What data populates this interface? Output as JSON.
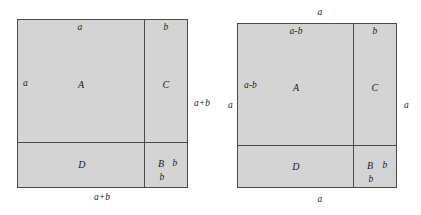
{
  "figure": {
    "type": "geometric-proof-diagram",
    "fill_color": "#d4d4d4",
    "line_color": "#4a4a4a",
    "text_color": "#1a1a1a",
    "background_color": "#ffffff"
  },
  "left_diagram": {
    "name": "left-square",
    "side_label": "a+b",
    "outer_labels": {
      "right": "a+b",
      "bottom": "a+b"
    },
    "inner_labels": {
      "top_left_width": "a",
      "top_right_width": "b",
      "left_height": "a"
    },
    "regions": [
      {
        "id": "A",
        "label": "A",
        "position": "top-left"
      },
      {
        "id": "C",
        "label": "C",
        "position": "top-right"
      },
      {
        "id": "D",
        "label": "D",
        "position": "bottom-left"
      },
      {
        "id": "B",
        "label": "B",
        "position": "bottom-right"
      }
    ],
    "small_square_labels": {
      "right": "b",
      "bottom": "b"
    }
  },
  "right_diagram": {
    "name": "right-square",
    "side_label": "a",
    "outer_labels": {
      "top": "a",
      "left": "a",
      "right": "a",
      "bottom": "a"
    },
    "inner_labels": {
      "top_left_width": "a-b",
      "top_right_width": "b",
      "left_height": "a-b"
    },
    "regions": [
      {
        "id": "A",
        "label": "A",
        "position": "top-left"
      },
      {
        "id": "C",
        "label": "C",
        "position": "top-right"
      },
      {
        "id": "D",
        "label": "D",
        "position": "bottom-left"
      },
      {
        "id": "B",
        "label": "B",
        "position": "bottom-right"
      }
    ],
    "small_square_labels": {
      "right": "b",
      "bottom": "b"
    }
  }
}
